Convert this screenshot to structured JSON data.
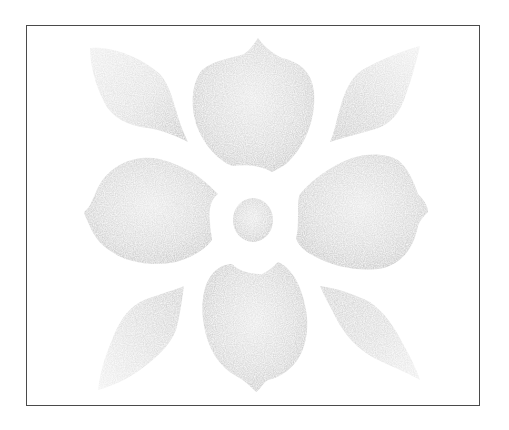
{
  "image": {
    "subject": "Stencil flower motif",
    "description": "Grey sponge-textured stencil print of a stylized flower: round center, four large petals (top, bottom, left, right) and four diagonal leaves, enclosed in a thin dark rectangular frame.",
    "colors": {
      "background": "#ffffff",
      "frame": "#4a4a4a",
      "paint_dark": "#b4b4b4",
      "paint_mid": "#c9c9c9",
      "paint_light": "#e2e2e2"
    },
    "frame": {
      "x": 26,
      "y": 25,
      "width": 454,
      "height": 381
    },
    "elements": [
      {
        "name": "center-circle",
        "cx": 253,
        "cy": 220,
        "r": 21
      },
      {
        "name": "petal-top",
        "bbox": [
          192,
          38,
          314,
          172
        ]
      },
      {
        "name": "petal-bottom",
        "bbox": [
          202,
          263,
          308,
          392
        ]
      },
      {
        "name": "petal-left",
        "bbox": [
          83,
          156,
          218,
          265
        ]
      },
      {
        "name": "petal-right",
        "bbox": [
          296,
          153,
          428,
          270
        ]
      },
      {
        "name": "leaf-top-left",
        "bbox": [
          88,
          45,
          188,
          142
        ]
      },
      {
        "name": "leaf-top-right",
        "bbox": [
          330,
          45,
          420,
          142
        ]
      },
      {
        "name": "leaf-bottom-left",
        "bbox": [
          98,
          286,
          184,
          390
        ]
      },
      {
        "name": "leaf-bottom-right",
        "bbox": [
          320,
          285,
          420,
          380
        ]
      }
    ]
  }
}
